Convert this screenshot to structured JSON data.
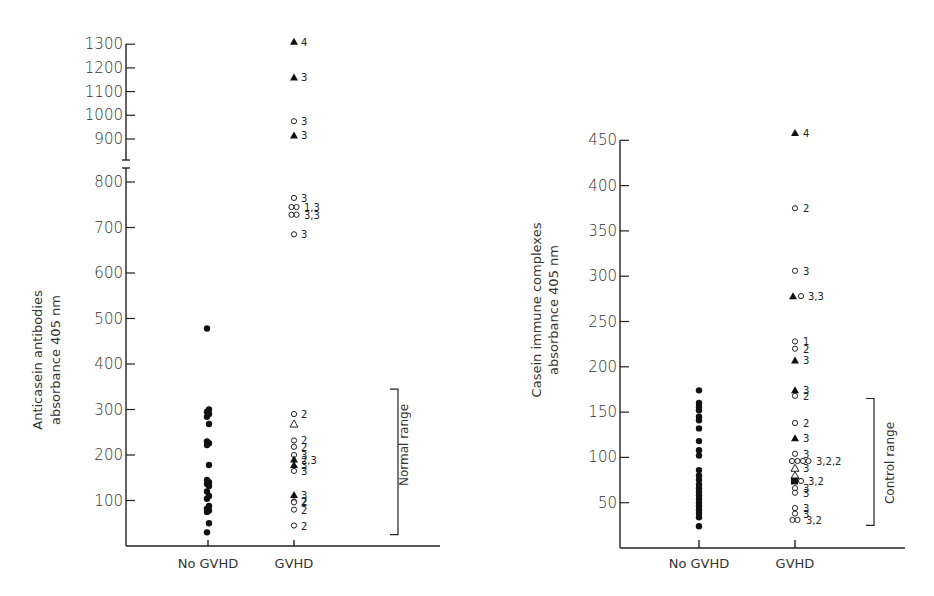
{
  "chart_data": [
    {
      "type": "scatter",
      "title": "",
      "ylabel": "Anticasein antibodies absorbance 405 nm",
      "ylabel_lines": [
        "Anticasein antibodies",
        "absorbance 405 nm"
      ],
      "xlabel": "",
      "categories": [
        "No GVHD",
        "GVHD"
      ],
      "yticks_lower": [
        100,
        200,
        300,
        400,
        500,
        600,
        700,
        800
      ],
      "yticks_upper": [
        900,
        1000,
        1100,
        1200,
        1300
      ],
      "axis_break": [
        820,
        880
      ],
      "ylim": [
        0,
        1300
      ],
      "grid": false,
      "reference_range": {
        "label": "Normal range",
        "low": 25,
        "high": 345
      },
      "series": [
        {
          "name": "No GVHD",
          "marker": "filled-circle",
          "points": [
            {
              "y": 478
            },
            {
              "y": 300
            },
            {
              "y": 295
            },
            {
              "y": 290
            },
            {
              "y": 284
            },
            {
              "y": 268
            },
            {
              "y": 230
            },
            {
              "y": 226
            },
            {
              "y": 222
            },
            {
              "y": 178
            },
            {
              "y": 145
            },
            {
              "y": 140
            },
            {
              "y": 136
            },
            {
              "y": 132
            },
            {
              "y": 120
            },
            {
              "y": 110
            },
            {
              "y": 104
            },
            {
              "y": 88
            },
            {
              "y": 82
            },
            {
              "y": 78
            },
            {
              "y": 75
            },
            {
              "y": 50
            },
            {
              "y": 30
            }
          ]
        },
        {
          "name": "GVHD",
          "points": [
            {
              "y": 1310,
              "marker": "filled-triangle",
              "label": "4"
            },
            {
              "y": 1160,
              "marker": "filled-triangle",
              "label": "3"
            },
            {
              "y": 975,
              "marker": "open-circle",
              "label": "3"
            },
            {
              "y": 915,
              "marker": "filled-triangle",
              "label": "3"
            },
            {
              "y": 765,
              "marker": "open-circle",
              "label": "3"
            },
            {
              "y": 745,
              "marker": "open-circle-pair",
              "label": "1,3"
            },
            {
              "y": 728,
              "marker": "open-circle-pair",
              "label": "3,3"
            },
            {
              "y": 685,
              "marker": "open-circle",
              "label": "3"
            },
            {
              "y": 290,
              "marker": "open-circle",
              "label": "2"
            },
            {
              "y": 268,
              "marker": "open-triangle",
              "label": ""
            },
            {
              "y": 232,
              "marker": "open-circle",
              "label": "2"
            },
            {
              "y": 218,
              "marker": "open-circle",
              "label": "2"
            },
            {
              "y": 200,
              "marker": "open-circle",
              "label": "3"
            },
            {
              "y": 190,
              "marker": "filled-triangle",
              "label": "2,3"
            },
            {
              "y": 178,
              "marker": "filled-triangle",
              "label": "3"
            },
            {
              "y": 165,
              "marker": "open-circle",
              "label": "3"
            },
            {
              "y": 112,
              "marker": "filled-triangle",
              "label": "3"
            },
            {
              "y": 98,
              "marker": "open-circle",
              "label": "2"
            },
            {
              "y": 96,
              "marker": "open-circle",
              "label": "2"
            },
            {
              "y": 80,
              "marker": "open-circle",
              "label": "2"
            },
            {
              "y": 45,
              "marker": "open-circle",
              "label": "2"
            }
          ]
        }
      ]
    },
    {
      "type": "scatter",
      "title": "",
      "ylabel": "Casein immune complexes absorbance 405 nm",
      "ylabel_lines": [
        "Casein immune complexes",
        "absorbance 405 nm"
      ],
      "xlabel": "",
      "categories": [
        "No GVHD",
        "GVHD"
      ],
      "yticks": [
        50,
        100,
        150,
        200,
        250,
        300,
        350,
        400,
        450
      ],
      "ylim": [
        0,
        450
      ],
      "grid": false,
      "reference_range": {
        "label": "Control range",
        "low": 25,
        "high": 165
      },
      "series": [
        {
          "name": "No GVHD",
          "marker": "filled-circle",
          "points": [
            {
              "y": 174
            },
            {
              "y": 160
            },
            {
              "y": 156
            },
            {
              "y": 152
            },
            {
              "y": 145
            },
            {
              "y": 141
            },
            {
              "y": 132
            },
            {
              "y": 118
            },
            {
              "y": 108
            },
            {
              "y": 102
            },
            {
              "y": 86
            },
            {
              "y": 80
            },
            {
              "y": 75
            },
            {
              "y": 70
            },
            {
              "y": 66
            },
            {
              "y": 62
            },
            {
              "y": 58
            },
            {
              "y": 54
            },
            {
              "y": 50
            },
            {
              "y": 46
            },
            {
              "y": 42
            },
            {
              "y": 38
            },
            {
              "y": 34
            },
            {
              "y": 24
            }
          ]
        },
        {
          "name": "GVHD",
          "points": [
            {
              "y": 458,
              "marker": "filled-triangle",
              "label": "4"
            },
            {
              "y": 375,
              "marker": "open-circle",
              "label": "2"
            },
            {
              "y": 306,
              "marker": "open-circle",
              "label": "3"
            },
            {
              "y": 278,
              "marker": "filled-triangle+open-circle",
              "label": "3,3"
            },
            {
              "y": 228,
              "marker": "open-circle",
              "label": "1"
            },
            {
              "y": 220,
              "marker": "open-circle",
              "label": "2"
            },
            {
              "y": 207,
              "marker": "filled-triangle",
              "label": "3"
            },
            {
              "y": 174,
              "marker": "filled-triangle",
              "label": "3"
            },
            {
              "y": 168,
              "marker": "open-circle",
              "label": "2"
            },
            {
              "y": 138,
              "marker": "open-circle",
              "label": "2"
            },
            {
              "y": 121,
              "marker": "filled-triangle",
              "label": "3"
            },
            {
              "y": 104,
              "marker": "open-circle",
              "label": "3"
            },
            {
              "y": 96,
              "marker": "open-circle-quad",
              "label": "3,2,2"
            },
            {
              "y": 88,
              "marker": "open-triangle",
              "label": "3"
            },
            {
              "y": 80,
              "marker": "open-triangle",
              "label": ""
            },
            {
              "y": 74,
              "marker": "filled-square+open-circle",
              "label": "3,2"
            },
            {
              "y": 66,
              "marker": "open-circle",
              "label": "3"
            },
            {
              "y": 61,
              "marker": "open-circle",
              "label": "3"
            },
            {
              "y": 44,
              "marker": "open-circle",
              "label": "3"
            },
            {
              "y": 38,
              "marker": "open-circle",
              "label": "3"
            },
            {
              "y": 31,
              "marker": "open-circle-pair",
              "label": "3,2"
            }
          ]
        }
      ]
    }
  ],
  "left_chart": {
    "ylabel_line1": "Anticasein antibodies",
    "ylabel_line2": "absorbance 405 nm",
    "range_label": "Normal range",
    "cat1": "No GVHD",
    "cat2": "GVHD"
  },
  "right_chart": {
    "ylabel_line1": "Casein immune complexes",
    "ylabel_line2": "absorbance 405 nm",
    "range_label": "Control range",
    "cat1": "No GVHD",
    "cat2": "GVHD"
  }
}
